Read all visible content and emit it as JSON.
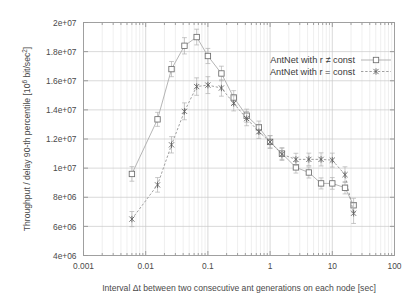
{
  "chart_data": {
    "type": "line",
    "title": "",
    "xlabel": "Interval Δt between two consecutive ant generations on each node [sec]",
    "ylabel": "Throughput / delay 90-th percentile [10⁶ bit/sec²]",
    "xscale": "log",
    "yscale": "linear",
    "xlim": [
      0.001,
      100
    ],
    "ylim": [
      4000000,
      20000000
    ],
    "grid": true,
    "legend_position": "top-right",
    "xticks": [
      0.001,
      0.01,
      0.1,
      1,
      10,
      100
    ],
    "xtick_labels": [
      "0.001",
      "0.01",
      "0.1",
      "1",
      "10",
      "100"
    ],
    "yticks": [
      4000000,
      6000000,
      8000000,
      10000000,
      12000000,
      14000000,
      16000000,
      18000000,
      20000000
    ],
    "ytick_labels": [
      "4e+06",
      "6e+06",
      "8e+06",
      "1e+07",
      "1.2e+07",
      "1.4e+07",
      "1.6e+07",
      "1.8e+07",
      "2e+07"
    ],
    "series": [
      {
        "name": "AntNet with r ≠ const",
        "marker": "open-square",
        "linestyle": "solid",
        "color": "#a8a8a8",
        "x": [
          0.006,
          0.0155,
          0.026,
          0.042,
          0.066,
          0.1,
          0.165,
          0.26,
          0.42,
          0.66,
          1.0,
          1.55,
          2.6,
          4.2,
          6.6,
          10.0,
          16.0,
          22.0
        ],
        "y": [
          9600000,
          13350000,
          16800000,
          18400000,
          19000000,
          17700000,
          16500000,
          14850000,
          13600000,
          12800000,
          11800000,
          11000000,
          10050000,
          9700000,
          8950000,
          8950000,
          8650000,
          7450000
        ],
        "yerr": [
          500000,
          480000,
          520000,
          560000,
          540000,
          520000,
          500000,
          470000,
          450000,
          430000,
          420000,
          400000,
          390000,
          380000,
          380000,
          400000,
          420000,
          480000
        ]
      },
      {
        "name": "AntNet with r = const",
        "marker": "cross",
        "linestyle": "dashed",
        "color": "#8f8f8f",
        "x": [
          0.006,
          0.0155,
          0.026,
          0.042,
          0.066,
          0.1,
          0.165,
          0.26,
          0.42,
          0.66,
          1.0,
          1.55,
          2.6,
          4.2,
          6.6,
          10.0,
          16.0,
          22.0
        ],
        "y": [
          6500000,
          8850000,
          11600000,
          13900000,
          15600000,
          15700000,
          15500000,
          14450000,
          13400000,
          12500000,
          11800000,
          10950000,
          10600000,
          10600000,
          10600000,
          10550000,
          9550000,
          6900000
        ],
        "yerr": [
          520000,
          500000,
          560000,
          580000,
          600000,
          580000,
          560000,
          520000,
          490000,
          460000,
          440000,
          420000,
          420000,
          430000,
          450000,
          480000,
          540000,
          700000
        ]
      }
    ]
  },
  "legend": {
    "entries": [
      {
        "label": "AntNet with r ≠ const"
      },
      {
        "label": "AntNet with r = const"
      }
    ]
  }
}
